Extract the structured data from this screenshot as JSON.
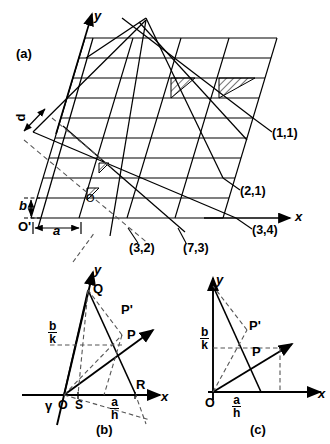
{
  "figure": {
    "title_panels": [
      "(a)",
      "(b)",
      "(c)"
    ]
  },
  "panel_a": {
    "label": "(a)",
    "axis_x": "x",
    "axis_y": "y",
    "origin_primary": "O",
    "origin_prime": "O'",
    "spacing_label": "d",
    "cell_a": "a",
    "cell_b": "b",
    "plane_labels": [
      {
        "text": "(1,1)"
      },
      {
        "text": "(2,1)"
      },
      {
        "text": "(3,4)"
      },
      {
        "text": "(3,2)"
      },
      {
        "text": "(7,3)"
      }
    ]
  },
  "panel_b": {
    "label": "(b)",
    "axis_x": "x",
    "axis_y": "y",
    "origin": "O",
    "angle": "γ",
    "points": [
      "Q",
      "P",
      "P'",
      "R",
      "S"
    ],
    "intercept_b": {
      "num": "b",
      "den": "k"
    },
    "intercept_a": {
      "num": "a",
      "den": "h"
    }
  },
  "panel_c": {
    "label": "(c)",
    "axis_x": "x",
    "axis_y": "y",
    "origin": "O",
    "points": [
      "P",
      "P'"
    ],
    "intercept_b": {
      "num": "b",
      "den": "k"
    },
    "intercept_a": {
      "num": "a",
      "den": "h"
    }
  },
  "style": {
    "ink": "#000000",
    "hatch": "#000000",
    "dash": "#555555"
  }
}
